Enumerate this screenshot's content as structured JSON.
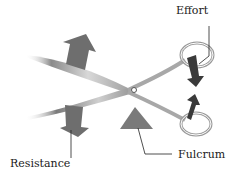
{
  "diagram": {
    "labels": {
      "effort": "Effort",
      "resistance": "Resistance",
      "fulcrum": "Fulcrum"
    },
    "colors": {
      "arrow": "#6e6e6e",
      "effort_arrow": "#3a3a3a",
      "blade": "#b8b8b8",
      "handle": "#9a9a9a",
      "text": "#1a1a1a",
      "background": "#ffffff"
    }
  }
}
